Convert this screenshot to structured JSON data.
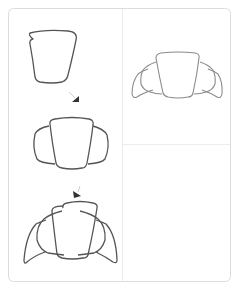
{
  "tutorial": {
    "subject": "croissant",
    "steps": [
      {
        "index": 1,
        "shape": "trapezoid-body",
        "description": "Draw a rounded trapezoid for the center of the croissant"
      },
      {
        "index": 2,
        "shape": "body-with-inner-lobes",
        "description": "Add a rounded lobe on each side"
      },
      {
        "index": 3,
        "shape": "body-with-outer-tips",
        "description": "Add pointed tips curving down on each side"
      }
    ],
    "result": {
      "shape": "finished-croissant",
      "description": "Finished croissant outline"
    }
  },
  "colors": {
    "stroke_dark": "#555555",
    "stroke_light": "#8a8a8a",
    "border": "#e2e2e2",
    "divider": "#ececec",
    "arrow": "#333333",
    "background": "#ffffff"
  }
}
